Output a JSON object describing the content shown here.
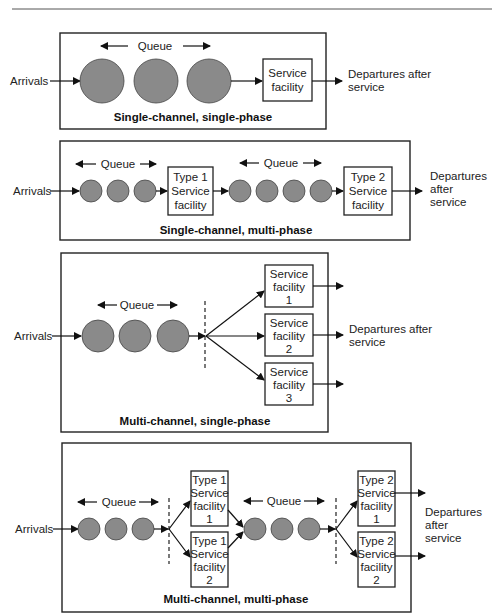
{
  "colors": {
    "circle_fill": "#8a8a8a",
    "line": "#111111",
    "background": "#ffffff"
  },
  "panels": [
    {
      "title": "Single-channel, single-phase",
      "arrivals": "Arrivals",
      "queue": "Queue",
      "facilities": [
        {
          "lines": [
            "Service",
            "facility"
          ]
        }
      ],
      "departures": [
        "Departures after",
        "service"
      ]
    },
    {
      "title": "Single-channel, multi-phase",
      "arrivals": "Arrivals",
      "queue1": "Queue",
      "queue2": "Queue",
      "facilities": [
        {
          "lines": [
            "Type 1",
            "Service",
            "facility"
          ]
        },
        {
          "lines": [
            "Type 2",
            "Service",
            "facility"
          ]
        }
      ],
      "departures": [
        "Departures",
        "after",
        "service"
      ]
    },
    {
      "title": "Multi-channel, single-phase",
      "arrivals": "Arrivals",
      "queue": "Queue",
      "facilities": [
        {
          "lines": [
            "Service",
            "facility",
            "1"
          ]
        },
        {
          "lines": [
            "Service",
            "facility",
            "2"
          ]
        },
        {
          "lines": [
            "Service",
            "facility",
            "3"
          ]
        }
      ],
      "departures": [
        "Departures after",
        "service"
      ]
    },
    {
      "title": "Multi-channel, multi-phase",
      "arrivals": "Arrivals",
      "queue1": "Queue",
      "queue2": "Queue",
      "facilities": [
        {
          "lines": [
            "Type 1",
            "Service",
            "facility",
            "1"
          ]
        },
        {
          "lines": [
            "Type 1",
            "Service",
            "facility",
            "2"
          ]
        },
        {
          "lines": [
            "Type 2",
            "Service",
            "facility",
            "1"
          ]
        },
        {
          "lines": [
            "Type 2",
            "Service",
            "facility",
            "2"
          ]
        }
      ],
      "departures": [
        "Departures",
        "after",
        "service"
      ]
    }
  ]
}
